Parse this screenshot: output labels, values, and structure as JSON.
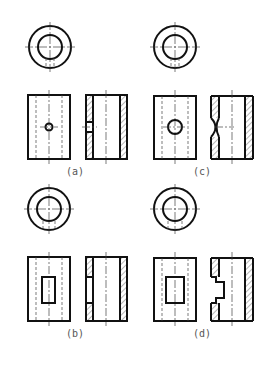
{
  "figure": {
    "panels": [
      {
        "id": "a",
        "label": "(a)",
        "feature": "small round hole"
      },
      {
        "id": "c",
        "label": "(c)",
        "feature": "large round hole"
      },
      {
        "id": "b",
        "label": "(b)",
        "feature": "narrow rectangular slot"
      },
      {
        "id": "d",
        "label": "(d)",
        "feature": "wide rectangular slot"
      }
    ]
  },
  "colors": {
    "line": "#111111",
    "background": "#ffffff",
    "label": "#555555"
  }
}
